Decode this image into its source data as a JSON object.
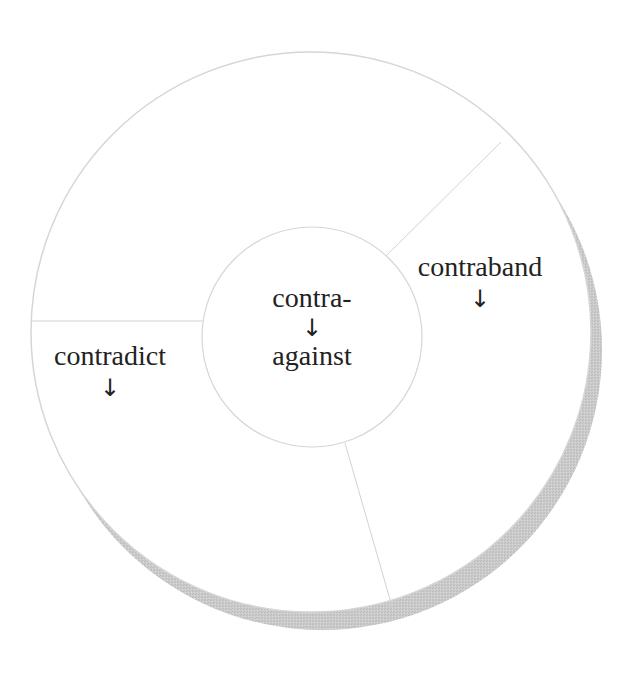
{
  "diagram": {
    "type": "root-word wheel",
    "colors": {
      "background": "#ffffff",
      "circle_fill": "#ffffff",
      "circle_stroke": "#d4d4d4",
      "divider_stroke": "#d0d0d0",
      "shadow": "#c9c9c9",
      "text": "#222222"
    },
    "center": {
      "root": "contra-",
      "arrow": "↓",
      "meaning": "against"
    },
    "segments": [
      {
        "word": "contraband",
        "arrow": "↓"
      },
      {
        "word": "contradict",
        "arrow": "↓"
      },
      {
        "word": "",
        "arrow": ""
      }
    ]
  }
}
